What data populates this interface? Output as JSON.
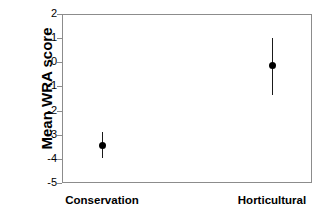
{
  "chart_data": {
    "type": "scatter",
    "title": "",
    "xlabel": "",
    "ylabel": "Mean WRA score",
    "categories": [
      "Conservation",
      "Horticultural"
    ],
    "values": [
      -3.45,
      -0.15
    ],
    "error_low": [
      -3.95,
      -1.35
    ],
    "error_high": [
      -2.9,
      1.0
    ],
    "ylim": [
      -5,
      2
    ],
    "yticks": [
      2,
      1,
      0,
      -1,
      -2,
      -3,
      -4,
      -5
    ],
    "ytick_labels": [
      "2",
      "1",
      "0",
      "-1",
      "-2",
      "-3",
      "-4",
      "-5"
    ],
    "grid": false,
    "legend": "none",
    "series": [
      {
        "name": "Mean WRA score",
        "points": [
          {
            "category": "Conservation",
            "mean": -3.45,
            "low": -3.95,
            "high": -2.9
          },
          {
            "category": "Horticultural",
            "mean": -0.15,
            "low": -1.35,
            "high": 1.0
          }
        ]
      }
    ],
    "colors": {
      "marker": "#000000",
      "errorbar": "#1a1a1a",
      "axis": "#8c8c8c",
      "text": "#000000",
      "background": "#ffffff"
    }
  },
  "axis": {
    "y_title": "Mean WRA score",
    "ticks": [
      {
        "label": "2",
        "value": 2
      },
      {
        "label": "1",
        "value": 1
      },
      {
        "label": "0",
        "value": 0
      },
      {
        "label": "-1",
        "value": -1
      },
      {
        "label": "-2",
        "value": -2
      },
      {
        "label": "-3",
        "value": -3
      },
      {
        "label": "-4",
        "value": -4
      },
      {
        "label": "-5",
        "value": -5
      }
    ]
  },
  "x_labels": [
    {
      "label": "Conservation"
    },
    {
      "label": "Horticultural"
    }
  ]
}
